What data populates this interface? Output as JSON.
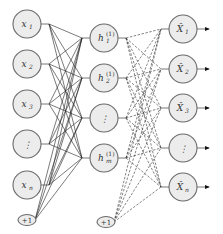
{
  "diagram": {
    "type": "autoencoder-network",
    "input_layer": {
      "nodes": [
        {
          "label": "x",
          "sub": "1",
          "y": 24
        },
        {
          "label": "x",
          "sub": "2",
          "y": 64
        },
        {
          "label": "x",
          "sub": "3",
          "y": 104
        },
        {
          "label": "⋮",
          "sub": "",
          "y": 144
        },
        {
          "label": "x",
          "sub": "n",
          "y": 185
        }
      ],
      "bias": {
        "label": "+1",
        "y": 220
      },
      "x": 27
    },
    "hidden_layer": {
      "nodes": [
        {
          "label": "h",
          "sub": "1",
          "sup": "(1)",
          "y": 38
        },
        {
          "label": "h",
          "sub": "2",
          "sup": "(1)",
          "y": 78
        },
        {
          "label": "⋮",
          "sub": "",
          "sup": "",
          "y": 118
        },
        {
          "label": "h",
          "sub": "m",
          "sup": "(1)",
          "y": 158
        }
      ],
      "bias": {
        "label": "+1",
        "y": 222
      },
      "x": 104
    },
    "output_layer": {
      "nodes": [
        {
          "label": "X̂",
          "sub": "1",
          "y": 29
        },
        {
          "label": "X̂",
          "sub": "2",
          "y": 69
        },
        {
          "label": "X̂",
          "sub": "3",
          "y": 108
        },
        {
          "label": "⋮",
          "sub": "",
          "y": 148
        },
        {
          "label": "X̂",
          "sub": "n",
          "y": 187
        }
      ],
      "x": 183
    },
    "edges": {
      "input_to_hidden": "solid",
      "hidden_to_output": "dashed"
    },
    "colors": {
      "node_fill": "#ececec",
      "node_stroke": "#6a6a6a",
      "edge": "#222222"
    }
  }
}
